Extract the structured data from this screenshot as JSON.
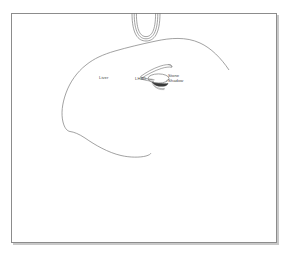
{
  "figure": {
    "kind": "medical-line-illustration",
    "background_color": "#ffffff",
    "ink_color": "#777777",
    "frame": {
      "border_color": "#8c8c8c",
      "shadow_color": "#c8c8c8"
    }
  },
  "labels": {
    "liver": "Liver",
    "lhbd": "LHBD",
    "stone_shadow_line1": "Stone",
    "stone_shadow_line2": "Shadow"
  },
  "structures": {
    "transducer_arc": "probe-arc",
    "liver_outline": "liver-contour",
    "needle": "aspiration-needle",
    "duct": "dilated-bile-duct",
    "stone": "stone",
    "acoustic_shadow": "acoustic-shadow"
  }
}
